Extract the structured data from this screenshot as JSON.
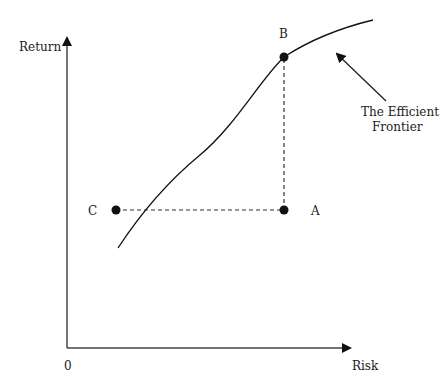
{
  "diagram": {
    "title": "Efficient Frontier",
    "axes": {
      "y_label": "Return",
      "x_label": "Risk",
      "origin_label": "0"
    },
    "points": [
      {
        "id": "B",
        "label": "B"
      },
      {
        "id": "A",
        "label": "A"
      },
      {
        "id": "C",
        "label": "C"
      }
    ],
    "annotation": {
      "line1": "The Efficient",
      "line2": "Frontier"
    },
    "colors": {
      "ink": "#111111",
      "axis": "#444444",
      "text": "#222222"
    }
  }
}
